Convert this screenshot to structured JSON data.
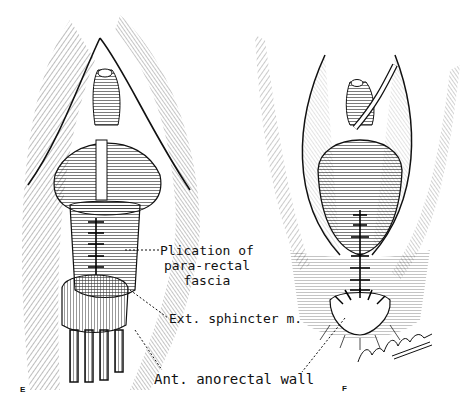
{
  "figure": {
    "panels": [
      {
        "letter": "E",
        "labels": {
          "plication": [
            "Plication of",
            "para-rectal",
            "fascia"
          ],
          "ext_sphincter": "Ext. sphincter m.",
          "ant_wall": "Ant. anorectal wall"
        }
      },
      {
        "letter": "F",
        "signature": "Leon Schlossberg '80"
      }
    ],
    "colors": {
      "ink": "#111111",
      "paper": "#ffffff"
    }
  }
}
